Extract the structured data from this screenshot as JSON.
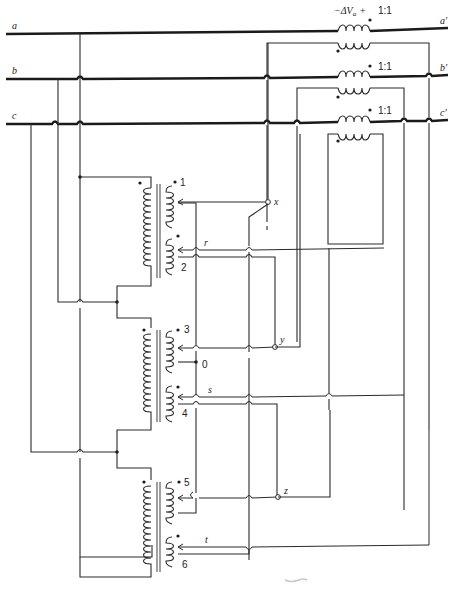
{
  "figure": {
    "buses": [
      {
        "id": "a",
        "left_label": "a",
        "right_label": "a'"
      },
      {
        "id": "b",
        "left_label": "b",
        "right_label": "b'"
      },
      {
        "id": "c",
        "left_label": "c",
        "right_label": "c'"
      }
    ],
    "series_transformers": [
      {
        "phase": "a",
        "label": "−ΔV",
        "subscript": "a",
        "sign": "+",
        "ratio": "1:1"
      },
      {
        "phase": "b",
        "ratio": "1:1"
      },
      {
        "phase": "c",
        "ratio": "1:1"
      }
    ],
    "exciting_transformers": [
      {
        "id": "T1",
        "winding_labels": [
          "1",
          "2"
        ],
        "tap_labels": [
          "x",
          "r"
        ]
      },
      {
        "id": "T2",
        "winding_labels": [
          "3",
          "4"
        ],
        "tap_labels": [
          "y",
          "s"
        ],
        "neutral_label": "0"
      },
      {
        "id": "T3",
        "winding_labels": [
          "5",
          "6"
        ],
        "tap_labels": [
          "z",
          "t"
        ]
      }
    ],
    "nodes": {
      "x": "x",
      "y": "y",
      "z": "z",
      "r": "r",
      "s": "s",
      "t": "t",
      "neutral": "0"
    }
  }
}
